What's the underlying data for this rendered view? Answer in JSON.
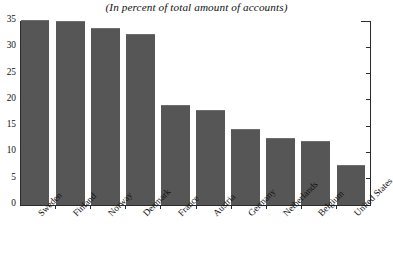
{
  "chart_data": {
    "type": "bar",
    "title": "(In percent of total amount of accounts)",
    "subtitle": "",
    "xlabel": "",
    "ylabel": "",
    "ylim": [
      0,
      35
    ],
    "yticks": [
      0,
      5,
      10,
      15,
      20,
      25,
      30,
      35
    ],
    "ytick_labels": [
      "0",
      "5",
      "10",
      "15",
      "20",
      "25",
      "30",
      "35"
    ],
    "grid": false,
    "legend": null,
    "bar_color": "#565656",
    "axis_color": "#2b2b2b",
    "categories": [
      "Sweden",
      "Finland",
      "Norway",
      "Denmark",
      "France",
      "Austria",
      "Germany",
      "Netherlands",
      "Belgium",
      "United States"
    ],
    "values": [
      35.0,
      34.8,
      33.4,
      32.3,
      18.8,
      17.8,
      14.2,
      12.6,
      11.9,
      7.5
    ],
    "series": [
      {
        "name": "Share of total amount of accounts",
        "values": [
          35.0,
          34.8,
          33.4,
          32.3,
          18.8,
          17.8,
          14.2,
          12.6,
          11.9,
          7.5
        ]
      }
    ],
    "annotations": []
  }
}
